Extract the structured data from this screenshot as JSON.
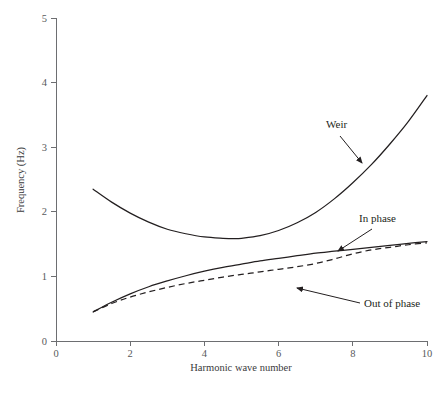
{
  "chart_data": {
    "type": "line",
    "title": "",
    "xlabel": "Harmonic wave number",
    "ylabel": "Frequency (Hz)",
    "xlim": [
      0,
      10
    ],
    "ylim": [
      0,
      5
    ],
    "xticks": [
      "0",
      "2",
      "4",
      "6",
      "8",
      "10"
    ],
    "xtick_values": [
      0,
      2,
      4,
      6,
      8,
      10
    ],
    "yticks": [
      "0",
      "1",
      "2",
      "3",
      "4",
      "5"
    ],
    "ytick_values": [
      0,
      1,
      2,
      3,
      4,
      5
    ],
    "grid": false,
    "legend": "inline-annotations",
    "series": [
      {
        "name": "Weir",
        "style": "solid",
        "color": "#231f20",
        "x": [
          1.0,
          1.5,
          2.0,
          2.5,
          3.0,
          3.5,
          4.0,
          4.5,
          4.8,
          5.0,
          5.5,
          6.0,
          6.5,
          7.0,
          7.5,
          8.0,
          8.5,
          9.0,
          9.5,
          10.0
        ],
        "values": [
          2.35,
          2.15,
          1.98,
          1.84,
          1.73,
          1.66,
          1.61,
          1.59,
          1.585,
          1.59,
          1.63,
          1.71,
          1.83,
          1.99,
          2.2,
          2.45,
          2.73,
          3.05,
          3.4,
          3.8
        ]
      },
      {
        "name": "In phase",
        "style": "solid",
        "color": "#231f20",
        "x": [
          1.0,
          1.5,
          2.0,
          2.5,
          3.0,
          3.5,
          4.0,
          4.5,
          5.0,
          5.5,
          6.0,
          6.5,
          7.0,
          7.5,
          8.0,
          8.5,
          9.0,
          9.5,
          10.0
        ],
        "values": [
          0.45,
          0.6,
          0.73,
          0.84,
          0.93,
          1.01,
          1.08,
          1.14,
          1.19,
          1.24,
          1.28,
          1.32,
          1.36,
          1.39,
          1.42,
          1.45,
          1.48,
          1.51,
          1.54
        ]
      },
      {
        "name": "Out of phase",
        "style": "dashed",
        "color": "#231f20",
        "x": [
          1.0,
          1.5,
          2.0,
          2.5,
          3.0,
          3.5,
          4.0,
          4.5,
          5.0,
          5.5,
          6.0,
          6.5,
          7.0,
          7.5,
          8.0,
          8.5,
          9.0,
          9.5,
          10.0
        ],
        "values": [
          0.45,
          0.58,
          0.68,
          0.76,
          0.83,
          0.89,
          0.94,
          0.99,
          1.03,
          1.07,
          1.11,
          1.15,
          1.2,
          1.27,
          1.35,
          1.41,
          1.45,
          1.49,
          1.52
        ]
      }
    ],
    "annotations": [
      {
        "text": "Weir",
        "label_x": 326,
        "label_y": 128,
        "anchor": "start",
        "arrow_from_x": 340,
        "arrow_from_y": 136,
        "arrow_to_x": 362,
        "arrow_to_y": 163
      },
      {
        "text": "In phase",
        "label_x": 359,
        "label_y": 222,
        "anchor": "start",
        "arrow_from_x": 372,
        "arrow_from_y": 229,
        "arrow_to_x": 338,
        "arrow_to_y": 251
      },
      {
        "text": "Out of phase",
        "label_x": 364,
        "label_y": 307,
        "anchor": "start",
        "arrow_from_x": 360,
        "arrow_from_y": 303,
        "arrow_to_x": 297,
        "arrow_to_y": 288
      }
    ]
  },
  "plot_geometry": {
    "left_px": 56,
    "right_px": 427,
    "bottom_px": 341,
    "top_px": 18
  },
  "caption": {
    "ghost_text": ""
  }
}
